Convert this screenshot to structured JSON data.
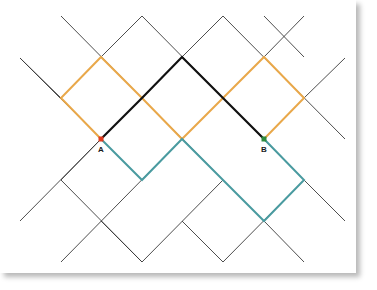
{
  "diagram": {
    "type": "lattice-paths",
    "colors": {
      "grid": "#3a3a3a",
      "path_black": "#111111",
      "path_orange": "#E9A84A",
      "path_teal": "#4A9BA0",
      "point_a": "#E03A1E",
      "point_b": "#2E8B3E",
      "background": "#ffffff"
    },
    "points": {
      "a": {
        "label": "A",
        "x": 101,
        "y": 139
      },
      "b": {
        "label": "B",
        "x": 264,
        "y": 139
      }
    },
    "grid_lines": [
      [
        20,
        58,
        142,
        180
      ],
      [
        61,
        16,
        223,
        180
      ],
      [
        142,
        16,
        304,
        180
      ],
      [
        223,
        16,
        345,
        139
      ],
      [
        264,
        16,
        304,
        57
      ],
      [
        61,
        180,
        142,
        262
      ],
      [
        20,
        221,
        101,
        139
      ],
      [
        61,
        262,
        182,
        139
      ],
      [
        142,
        262,
        223,
        180
      ],
      [
        223,
        262,
        304,
        180
      ],
      [
        304,
        180,
        345,
        221
      ],
      [
        101,
        221,
        142,
        262
      ],
      [
        182,
        221,
        223,
        262
      ],
      [
        264,
        221,
        304,
        262
      ],
      [
        101,
        57,
        142,
        16
      ],
      [
        182,
        57,
        223,
        16
      ],
      [
        264,
        57,
        304,
        16
      ],
      [
        304,
        98,
        345,
        58
      ],
      [
        182,
        139,
        223,
        98
      ],
      [
        101,
        139,
        61,
        98
      ],
      [
        20,
        58,
        61,
        98
      ],
      [
        61,
        180,
        101,
        139
      ]
    ],
    "paths": [
      {
        "name": "black-path",
        "color_key": "path_black",
        "points": [
          [
            101,
            139
          ],
          [
            142,
            98
          ],
          [
            182,
            57
          ],
          [
            223,
            98
          ],
          [
            264,
            139
          ]
        ]
      },
      {
        "name": "orange-path",
        "color_key": "path_orange",
        "points": [
          [
            101,
            139
          ],
          [
            61,
            98
          ],
          [
            101,
            57
          ],
          [
            142,
            98
          ],
          [
            182,
            139
          ],
          [
            223,
            98
          ],
          [
            264,
            57
          ],
          [
            304,
            98
          ],
          [
            264,
            139
          ]
        ]
      },
      {
        "name": "teal-path",
        "color_key": "path_teal",
        "points": [
          [
            101,
            139
          ],
          [
            142,
            180
          ],
          [
            182,
            139
          ],
          [
            223,
            180
          ],
          [
            264,
            221
          ],
          [
            304,
            180
          ],
          [
            264,
            139
          ]
        ]
      }
    ]
  }
}
